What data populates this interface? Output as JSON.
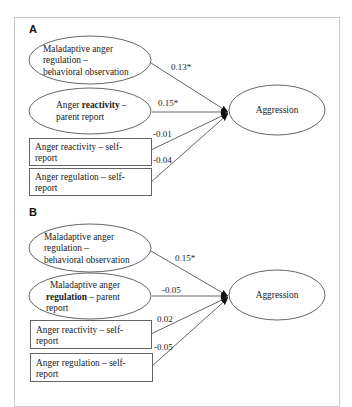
{
  "figure": {
    "panels": [
      {
        "label": "A",
        "outcome": "Aggression",
        "predictors": [
          {
            "shape": "ellipse",
            "lines": [
              "Maladaptive  anger",
              "regulation  –",
              "behavioral  observation"
            ],
            "bold_word": null,
            "coefficient": "0.13*"
          },
          {
            "shape": "ellipse",
            "lines_parts": [
              [
                "Anger ",
                "reactivity",
                " –"
              ],
              [
                "parent report"
              ]
            ],
            "bold_word": "reactivity",
            "coefficient": "0.15*"
          },
          {
            "shape": "rect",
            "lines": [
              "Anger  reactivity  – self-",
              "report"
            ],
            "bold_word": null,
            "coefficient": "-0.01"
          },
          {
            "shape": "rect",
            "lines": [
              "Anger  regulation  – self-",
              "report"
            ],
            "bold_word": null,
            "coefficient": "-0.04"
          }
        ]
      },
      {
        "label": "B",
        "outcome": "Aggression",
        "predictors": [
          {
            "shape": "ellipse",
            "lines": [
              "Maladaptive  anger",
              "regulation  –",
              "behavioral  observation"
            ],
            "bold_word": null,
            "coefficient": "0.15*"
          },
          {
            "shape": "ellipse",
            "lines_parts": [
              [
                "Maladaptive  anger"
              ],
              [
                "regulation",
                " – parent"
              ],
              [
                "report"
              ]
            ],
            "bold_word": "regulation",
            "coefficient": "-0.05"
          },
          {
            "shape": "rect",
            "lines": [
              "Anger  reactivity  – self-",
              "report"
            ],
            "bold_word": null,
            "coefficient": "0.02"
          },
          {
            "shape": "rect",
            "lines": [
              "Anger  regulation  – self-",
              "report"
            ],
            "bold_word": null,
            "coefficient": "-0.05"
          }
        ]
      }
    ]
  },
  "colors": {
    "stroke": "#555555",
    "frame": "#c8c8c8",
    "text": "#222222"
  }
}
